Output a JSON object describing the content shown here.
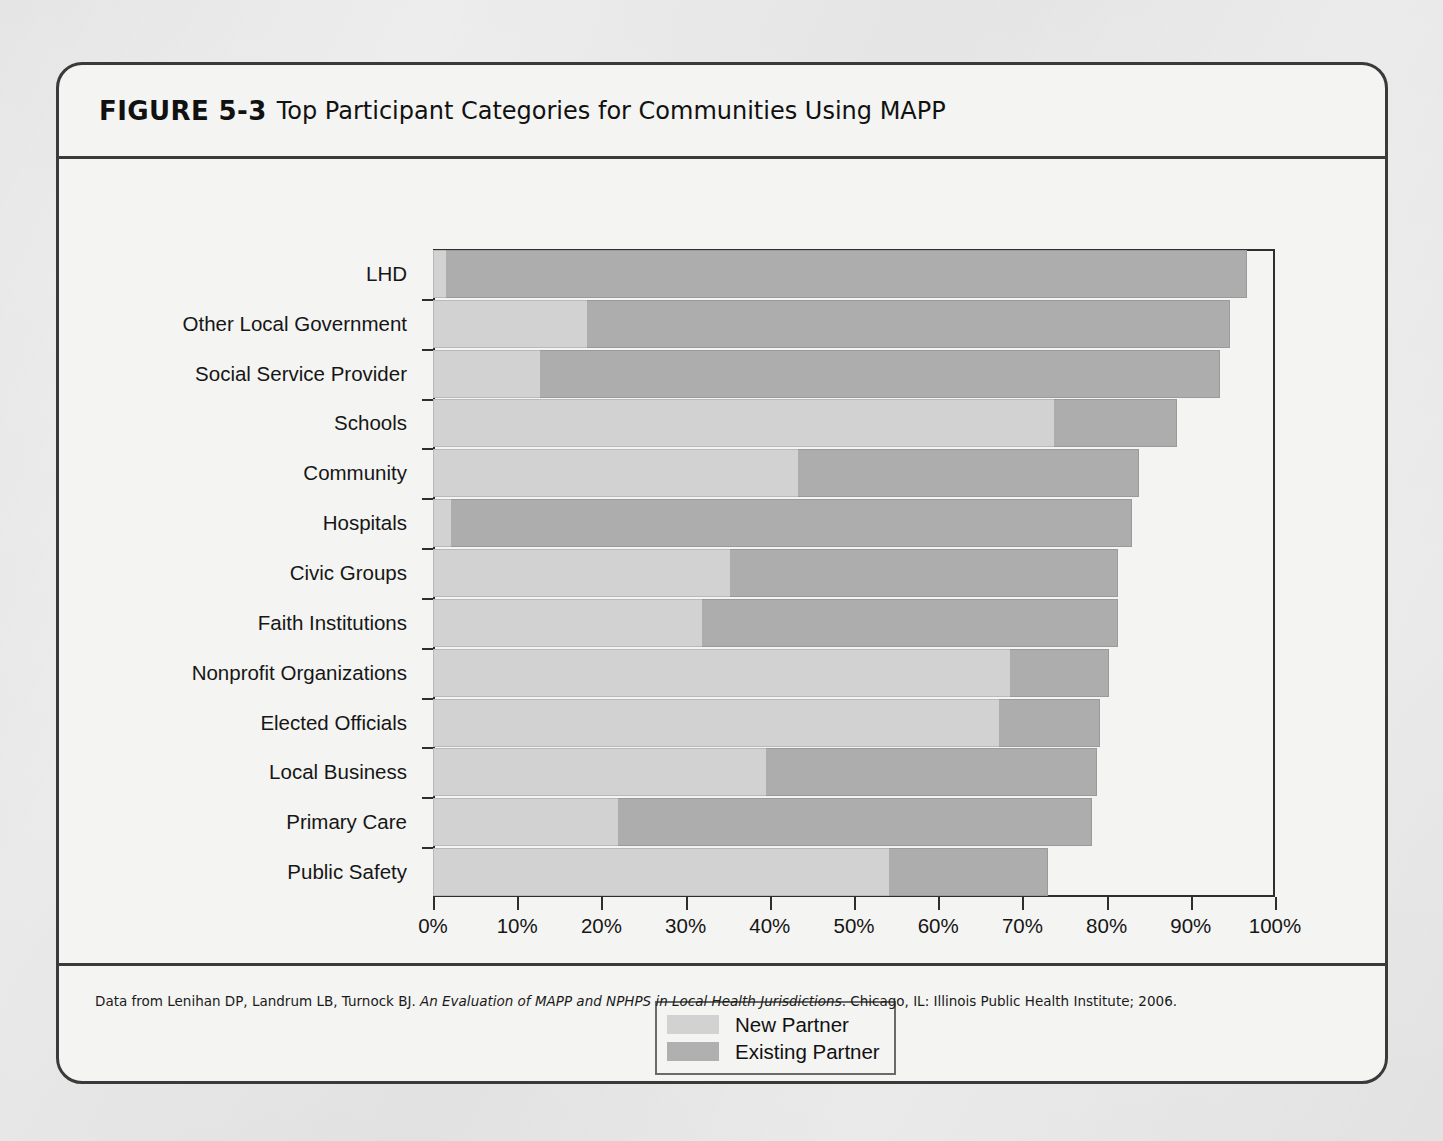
{
  "figure": {
    "number": "FIGURE 5-3",
    "title": "Top Participant Categories for Communities Using MAPP",
    "caption_prefix": "Data from Lenihan DP, Landrum LB, Turnock BJ. ",
    "caption_italic": "An Evaluation of MAPP and NPHPS in Local Health Jurisdictions",
    "caption_suffix": ". Chicago, IL: Illinois Public Health Institute; 2006."
  },
  "colors": {
    "new_partner": "#d2d2d2",
    "existing_partner": "#adadad",
    "frame": "#2e2e2e",
    "page": "#efefef",
    "panel": "#f4f4f2"
  },
  "legend": {
    "position": "bottom-center",
    "items": [
      {
        "label": "New Partner",
        "color": "#d2d2d2"
      },
      {
        "label": "Existing Partner",
        "color": "#b0b0b0"
      }
    ]
  },
  "chart_data": {
    "type": "bar",
    "orientation": "horizontal",
    "stacked": true,
    "title": "Top Participant Categories for Communities Using MAPP",
    "xlabel": "",
    "ylabel": "",
    "xlim": [
      0,
      100
    ],
    "xtick_labels": [
      "0%",
      "10%",
      "20%",
      "30%",
      "40%",
      "50%",
      "60%",
      "70%",
      "80%",
      "90%",
      "100%"
    ],
    "xticks": [
      0,
      10,
      20,
      30,
      40,
      50,
      60,
      70,
      80,
      90,
      100
    ],
    "grid": false,
    "categories": [
      "LHD",
      "Other Local Government",
      "Social Service Provider",
      "Schools",
      "Community",
      "Hospitals",
      "Civic Groups",
      "Faith Institutions",
      "Nonprofit Organizations",
      "Elected Officials",
      "Local Business",
      "Primary Care",
      "Public Safety"
    ],
    "series": [
      {
        "name": "New Partner",
        "color": "#d2d2d2",
        "values": [
          1.5,
          18.3,
          12.7,
          73.8,
          43.3,
          2.1,
          35.3,
          32.0,
          68.5,
          67.2,
          39.5,
          22.0,
          54.2
        ]
      },
      {
        "name": "Existing Partner",
        "color": "#adadad",
        "values": [
          95.2,
          76.3,
          80.8,
          14.6,
          40.6,
          80.9,
          46.1,
          49.3,
          11.8,
          12.0,
          39.4,
          56.3,
          18.9
        ]
      }
    ],
    "totals": [
      96.7,
      94.6,
      93.5,
      88.4,
      83.9,
      83.0,
      81.4,
      81.3,
      80.3,
      79.2,
      78.9,
      78.3,
      73.1
    ]
  }
}
